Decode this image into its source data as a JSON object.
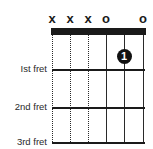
{
  "diagram": {
    "type": "guitar-chord-diagram",
    "string_markers": [
      "x",
      "x",
      "x",
      "o",
      "",
      "o"
    ],
    "string_styles": [
      "dotted",
      "dotted",
      "dotted",
      "solid",
      "solid",
      "solid"
    ],
    "fret_labels": [
      "Ist fret",
      "2nd fret",
      "3rd fret"
    ],
    "fingers": [
      {
        "string": 5,
        "fret": 1,
        "label": "1"
      }
    ],
    "colors": {
      "ink": "#1a1a1a",
      "background": "#ffffff",
      "finger_text": "#ffffff"
    }
  }
}
